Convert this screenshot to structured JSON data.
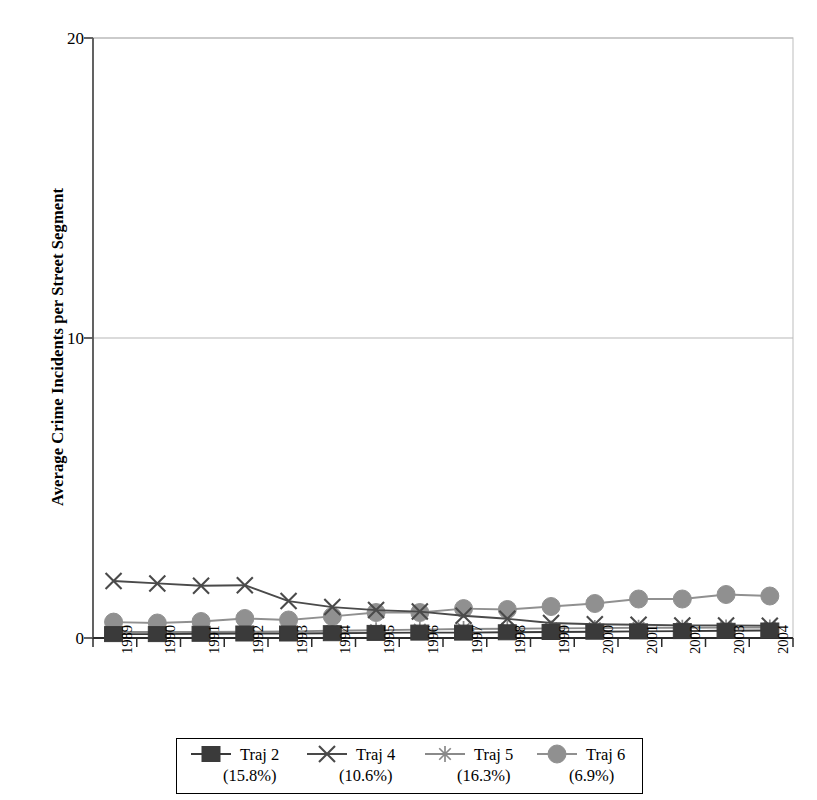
{
  "chart_data": {
    "type": "line",
    "title": "",
    "xlabel": "",
    "ylabel": "Average Crime Incidents per Street Segment",
    "categories": [
      "1989",
      "1990",
      "1991",
      "1992",
      "1993",
      "1994",
      "1995",
      "1996",
      "1997",
      "1998",
      "1999",
      "2000",
      "2001",
      "2002",
      "2003",
      "2004"
    ],
    "ylim": [
      0,
      20
    ],
    "yticks": [
      0,
      10,
      20
    ],
    "ytick_labels": [
      "0",
      "10",
      "20"
    ],
    "grid": "horizontal",
    "legend_position": "bottom",
    "series": [
      {
        "name": "Traj 2",
        "percent": "(15.8%)",
        "marker": "square",
        "color": "#3a3a3a",
        "values": [
          0.13,
          0.13,
          0.14,
          0.15,
          0.15,
          0.16,
          0.17,
          0.18,
          0.18,
          0.19,
          0.2,
          0.21,
          0.22,
          0.23,
          0.24,
          0.25
        ]
      },
      {
        "name": "Traj 4",
        "percent": "(10.6%)",
        "marker": "x",
        "color": "#4a4a4a",
        "values": [
          1.9,
          1.82,
          1.74,
          1.76,
          1.23,
          1.03,
          0.93,
          0.88,
          0.74,
          0.64,
          0.5,
          0.46,
          0.44,
          0.42,
          0.42,
          0.41
        ]
      },
      {
        "name": "Traj 5",
        "percent": "(16.3%)",
        "marker": "asterisk",
        "color": "#8a8a8a",
        "values": [
          0.2,
          0.2,
          0.2,
          0.21,
          0.22,
          0.24,
          0.26,
          0.28,
          0.3,
          0.31,
          0.32,
          0.33,
          0.34,
          0.34,
          0.35,
          0.35
        ]
      },
      {
        "name": "Traj 6",
        "percent": "(6.9%)",
        "marker": "circle",
        "color": "#909090",
        "values": [
          0.53,
          0.5,
          0.55,
          0.65,
          0.6,
          0.72,
          0.85,
          0.85,
          0.98,
          0.95,
          1.05,
          1.15,
          1.3,
          1.3,
          1.45,
          1.4
        ]
      }
    ]
  },
  "axis": {
    "y_title": "Average Crime Incidents per Street Segment",
    "y_tick_0": "0",
    "y_tick_10": "10",
    "y_tick_20": "20"
  },
  "legend": {
    "entries": [
      {
        "label": "Traj 2",
        "percent": "(15.8%)"
      },
      {
        "label": "Traj 4",
        "percent": "(10.6%)"
      },
      {
        "label": "Traj 5",
        "percent": "(16.3%)"
      },
      {
        "label": "Traj 6",
        "percent": "(6.9%)"
      }
    ]
  },
  "colors": {
    "axis": "#555555",
    "grid": "#b8b8b8",
    "plot_border": "#c8c8c8",
    "traj2": "#3a3a3a",
    "traj4": "#4a4a4a",
    "traj5": "#8a8a8a",
    "traj6": "#909090"
  }
}
